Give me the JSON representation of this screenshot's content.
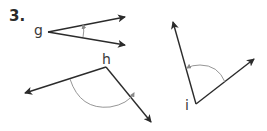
{
  "problem_number": "3.",
  "angles": [
    {
      "label": "g",
      "vertex": [
        48,
        32
      ],
      "ray_ends": [
        [
          125,
          17
        ],
        [
          125,
          45
        ]
      ],
      "arc": "small, between rays near x=83"
    },
    {
      "label": "h",
      "vertex": [
        106,
        67
      ],
      "ray_ends": [
        [
          25,
          93
        ],
        [
          151,
          122
        ]
      ],
      "arc": "large, below vertex"
    },
    {
      "label": "i",
      "vertex": [
        196,
        104
      ],
      "ray_ends": [
        [
          173,
          22
        ],
        [
          254,
          59
        ]
      ],
      "arc": "above vertex, between rays"
    }
  ],
  "colors": {
    "line": "#2b2b2b",
    "arc": "#8a8a8a",
    "text": "#2a2a2a"
  }
}
